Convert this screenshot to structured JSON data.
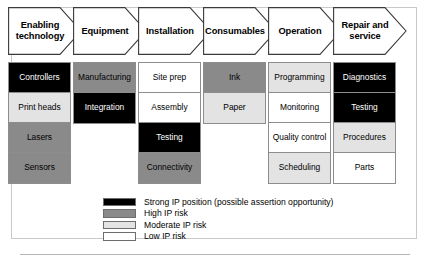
{
  "figure": {
    "type": "process-chevron-risk-matrix",
    "stages": [
      {
        "label": "Enabling technology",
        "items": [
          {
            "label": "Controllers",
            "level": "strong"
          },
          {
            "label": "Print heads",
            "level": "moderate"
          },
          {
            "label": "Lasers",
            "level": "high"
          },
          {
            "label": "Sensors",
            "level": "high"
          }
        ]
      },
      {
        "label": "Equipment",
        "items": [
          {
            "label": "Manufacturing",
            "level": "high"
          },
          {
            "label": "Integration",
            "level": "strong"
          }
        ]
      },
      {
        "label": "Installation",
        "items": [
          {
            "label": "Site prep",
            "level": "low"
          },
          {
            "label": "Assembly",
            "level": "low"
          },
          {
            "label": "Testing",
            "level": "strong"
          },
          {
            "label": "Connectivity",
            "level": "high"
          }
        ]
      },
      {
        "label": "Consumables",
        "items": [
          {
            "label": "Ink",
            "level": "high"
          },
          {
            "label": "Paper",
            "level": "moderate"
          }
        ]
      },
      {
        "label": "Operation",
        "items": [
          {
            "label": "Programming",
            "level": "moderate"
          },
          {
            "label": "Monitoring",
            "level": "low"
          },
          {
            "label": "Quality control",
            "level": "low"
          },
          {
            "label": "Scheduling",
            "level": "moderate"
          }
        ]
      },
      {
        "label": "Repair and service",
        "items": [
          {
            "label": "Diagnostics",
            "level": "strong"
          },
          {
            "label": "Testing",
            "level": "strong"
          },
          {
            "label": "Procedures",
            "level": "moderate"
          },
          {
            "label": "Parts",
            "level": "low"
          }
        ]
      }
    ]
  },
  "legend": {
    "items": [
      {
        "label": "Strong IP position (possible assertion opportunity)",
        "level": "strong"
      },
      {
        "label": "High IP risk",
        "level": "high"
      },
      {
        "label": "Moderate IP risk",
        "level": "moderate"
      },
      {
        "label": "Low IP risk",
        "level": "low"
      }
    ]
  },
  "colors": {
    "strong": "#000000",
    "high": "#8a8a8a",
    "moderate": "#e3e3e3",
    "low": "#ffffff",
    "outline": "#8d8d8d",
    "frame": "#c9c9c9",
    "rule": "#b6b6b6"
  }
}
